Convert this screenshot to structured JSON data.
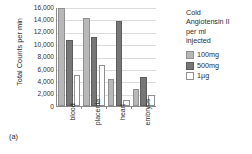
{
  "chart_data": {
    "type": "bar",
    "title": "",
    "xlabel": "",
    "ylabel": "Total Counts per min",
    "ylim": [
      0,
      16000
    ],
    "yticks": [
      16000,
      14000,
      12000,
      10000,
      8000,
      6000,
      4000,
      2000,
      0
    ],
    "ytick_labels": [
      "16,000",
      "14,000",
      "12,000",
      "10,000",
      "8,000",
      "6,000",
      "4,000",
      "2,000",
      "0"
    ],
    "grid": true,
    "legend_position": "right",
    "legend_title": "Cold Angiotensin II per ml injected",
    "categories": [
      "blood",
      "placenta",
      "heart",
      "embryos"
    ],
    "series": [
      {
        "name": "100mg",
        "color": "#b8b8b8",
        "values": [
          15800,
          14200,
          4400,
          2700
        ]
      },
      {
        "name": "500mg",
        "color": "#777777",
        "values": [
          10600,
          11100,
          13700,
          4700
        ]
      },
      {
        "name": "1µg",
        "color": "#ffffff",
        "values": [
          5000,
          6700,
          1000,
          1700
        ]
      }
    ]
  },
  "legend": {
    "title_lines": [
      "Cold",
      "Angiotensin II",
      "per ml",
      "injected"
    ],
    "items": [
      {
        "label": "100mg",
        "swatch": "s100"
      },
      {
        "label": "500mg",
        "swatch": "s500"
      },
      {
        "label": "1µg",
        "swatch": "s1ug"
      }
    ]
  },
  "caption": "(a)"
}
